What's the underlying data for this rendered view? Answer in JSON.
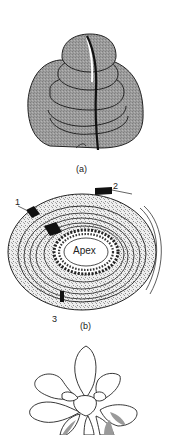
{
  "figure": {
    "panels": [
      {
        "id": "a",
        "caption": "(a)",
        "description": "Shoot apex bud with overlapping leaf primordia, shaded gray, with dark vertical line"
      },
      {
        "id": "b",
        "caption": "(b)",
        "description": "Transverse section of spiral leaf arrangement around apex",
        "center_label": "Apex",
        "markers": [
          "1",
          "2",
          "3"
        ]
      },
      {
        "id": "c",
        "caption": "",
        "description": "Rosette plant outline drawing"
      }
    ],
    "colors": {
      "shade": "#9a9a9a",
      "outline": "#222222",
      "stipple": "#e4e4e4",
      "background": "#ffffff"
    }
  }
}
